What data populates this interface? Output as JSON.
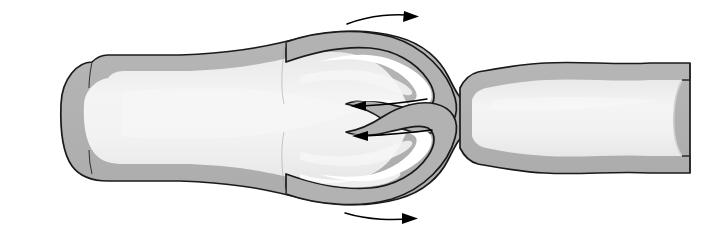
{
  "figure": {
    "name": "venous-valve-diagram",
    "width": 710,
    "height": 236,
    "background_color": "#ffffff"
  },
  "colors": {
    "background": "#ffffff",
    "vessel_wall": "#b2b2b2",
    "vessel_wall_shadow": "#a5a5a5",
    "lumen": "#efefef",
    "lumen_highlight": "#fafafa",
    "outline": "#1a1a1a",
    "arrow": "#000000"
  },
  "structures": [
    {
      "id": "vein-wall",
      "label": "vein wall",
      "fill": "#b2b2b2",
      "stroke": "#1a1a1a",
      "stroke_width": 1.6
    },
    {
      "id": "vein-lumen",
      "label": "vein lumen",
      "fill": "#efefef",
      "stroke": "none"
    },
    {
      "id": "valve-cusp-upper",
      "label": "upper valve cusp",
      "fill": "#b2b2b2",
      "stroke": "#1a1a1a"
    },
    {
      "id": "valve-cusp-lower",
      "label": "lower valve cusp",
      "fill": "#b2b2b2",
      "stroke": "#1a1a1a"
    },
    {
      "id": "valve-sinus-upper",
      "label": "upper valve sinus",
      "fill": "#ffffff"
    },
    {
      "id": "valve-sinus-lower",
      "label": "lower valve sinus",
      "fill": "#ffffff"
    },
    {
      "id": "cut-edge-right",
      "label": "cut end of vein",
      "fill": "#efefef"
    }
  ],
  "arrows": [
    {
      "id": "arrow-top",
      "label": "flow arrow top",
      "direction": "right",
      "x1": 347,
      "y1": 24,
      "x2": 418,
      "y2": 17
    },
    {
      "id": "arrow-mid-upper",
      "label": "flow arrow middle upper",
      "direction": "left",
      "x1": 427,
      "y1": 99,
      "x2": 350,
      "y2": 106
    },
    {
      "id": "arrow-mid-lower",
      "label": "flow arrow middle lower",
      "direction": "left",
      "x1": 430,
      "y1": 131,
      "x2": 352,
      "y2": 136
    },
    {
      "id": "arrow-bottom",
      "label": "flow arrow bottom",
      "direction": "right",
      "x1": 345,
      "y1": 219,
      "x2": 416,
      "y2": 214
    }
  ],
  "labels": {
    "caption": "",
    "annotations": []
  }
}
